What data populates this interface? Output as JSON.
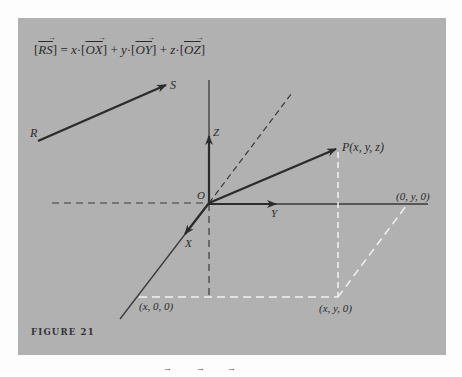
{
  "figure": {
    "caption": "FIGURE 21",
    "equation": {
      "lhs": "RS",
      "eq": "=",
      "terms": [
        {
          "coef": "x",
          "vec": "OX"
        },
        {
          "coef": "y",
          "vec": "OY"
        },
        {
          "coef": "z",
          "vec": "OZ"
        }
      ],
      "dot": "·",
      "plus": "+"
    },
    "labels": {
      "R": "R",
      "S": "S",
      "Z": "Z",
      "O": "O",
      "Y": "Y",
      "X": "X",
      "P": "P(x, y, z)",
      "y_point": "(0, y, 0)",
      "x_point": "(x, 0, 0)",
      "xy_point": "(x, y, 0)"
    },
    "bottom_fragment_arrows": [
      "→",
      "→",
      "→"
    ],
    "colors": {
      "panel": "#b1b1b1",
      "line": "#2b2b2b",
      "dash_light": "#f2f2f2",
      "page": "#fdfdfd"
    }
  }
}
